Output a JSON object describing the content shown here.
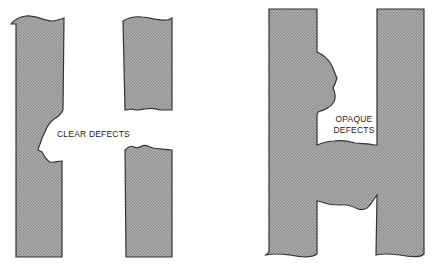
{
  "diagram": {
    "panels": [
      {
        "id": "clear",
        "label": "CLEAR DEFECTS",
        "description": "Conductor H pattern with missing material (clear defects)"
      },
      {
        "id": "opaque",
        "label_lines": [
          "OPAQUE",
          "DEFECTS"
        ],
        "description": "Conductor H pattern with extra material (opaque defects)"
      }
    ],
    "colors": {
      "fill": "#9a9a9a",
      "fill_light": "#bdbdbd",
      "stroke": "#333333",
      "background": "#ffffff"
    }
  }
}
